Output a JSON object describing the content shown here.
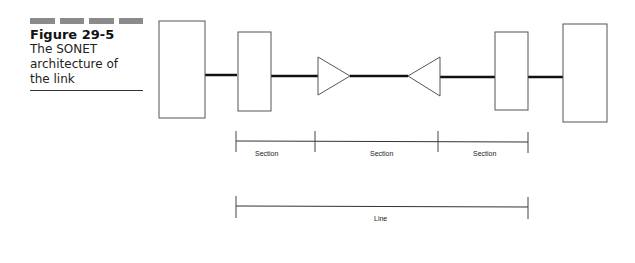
{
  "figure": {
    "number": "Figure 29-5",
    "title_lines": [
      "The SONET",
      "architecture of",
      "the link"
    ]
  },
  "diagram": {
    "labels": {
      "section_1": "Section",
      "section_2": "Section",
      "section_3": "Section",
      "line": "Line"
    },
    "elements": [
      "terminal-left",
      "add-drop-mux-left",
      "regenerator-right-pointing",
      "regenerator-left-pointing",
      "add-drop-mux-right",
      "terminal-right"
    ]
  }
}
